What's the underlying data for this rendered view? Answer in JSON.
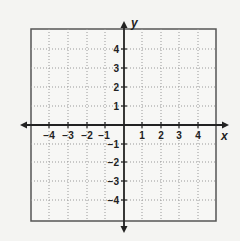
{
  "diagram": {
    "type": "coordinate-plane",
    "x_axis": {
      "label": "x",
      "ticks": [
        "−4",
        "−3",
        "−2",
        "−1",
        "1",
        "2",
        "3",
        "4"
      ],
      "range": [
        -5,
        5
      ]
    },
    "y_axis": {
      "label": "y",
      "ticks": [
        "4",
        "3",
        "2",
        "1",
        "−1",
        "−2",
        "−3",
        "−4"
      ],
      "range": [
        -5,
        5
      ]
    },
    "grid": {
      "style": "dotted",
      "spacing": 1
    },
    "colors": {
      "background": "#f4f4f2",
      "axis": "#222222",
      "grid": "#999999",
      "border": "#555555"
    }
  }
}
